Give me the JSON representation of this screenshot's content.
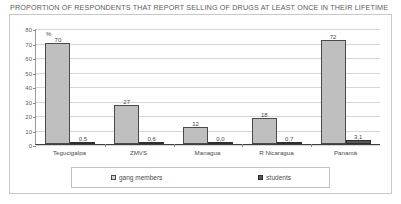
{
  "chart_data": {
    "type": "bar",
    "title": "PROPORTION OF RESPONDENTS THAT REPORT SELLING OF DRUGS AT LEAST ONCE IN THEIR LIFETIME",
    "xlabel": "",
    "ylabel": "%",
    "unit_note": "%",
    "ylim": [
      0,
      80
    ],
    "yticks": [
      80,
      70,
      60,
      50,
      40,
      30,
      20,
      10,
      0
    ],
    "grid": true,
    "legend_position": "bottom",
    "categories": [
      "Tegucigalpa",
      "ZMVS",
      "Managua",
      "R Nicaragua",
      "Panamá"
    ],
    "series": [
      {
        "name": "gang members",
        "color": "#bfbfbf",
        "values": [
          70,
          27,
          12,
          18,
          72
        ],
        "labels": [
          "70",
          "27",
          "12",
          "18",
          "72"
        ]
      },
      {
        "name": "students",
        "color": "#575757",
        "values": [
          0.5,
          0.6,
          0.0,
          0.7,
          3.1
        ],
        "labels": [
          "0,5",
          "0,6",
          "0,0",
          "0,7",
          "3,1"
        ]
      }
    ]
  }
}
